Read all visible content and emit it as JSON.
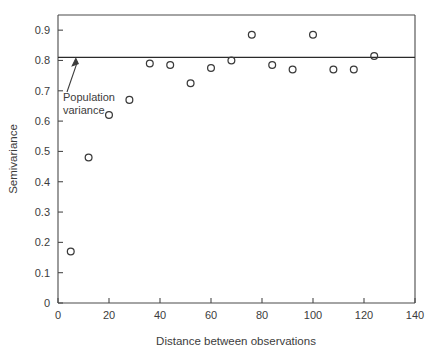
{
  "chart_data": {
    "type": "scatter",
    "title": "",
    "xlabel": "Distance between observations",
    "ylabel": "Semivariance",
    "xlim": [
      0,
      140
    ],
    "ylim": [
      0,
      0.95
    ],
    "xticks": [
      0,
      20,
      40,
      60,
      80,
      100,
      120,
      140
    ],
    "xtick_labels": [
      "0",
      "20",
      "40",
      "60",
      "80",
      "100",
      "120",
      "140"
    ],
    "yticks": [
      0,
      0.1,
      0.2,
      0.3,
      0.4,
      0.5,
      0.6,
      0.7,
      0.8,
      0.9
    ],
    "ytick_labels": [
      "0",
      "0.1",
      "0.2",
      "0.3",
      "0.4",
      "0.5",
      "0.6",
      "0.7",
      "0.8",
      "0.9"
    ],
    "grid": false,
    "legend": null,
    "marker": "open-circle",
    "marker_color": "#3a3a3a",
    "series": [
      {
        "name": "Empirical semivariogram",
        "x": [
          5,
          12,
          20,
          28,
          36,
          44,
          52,
          60,
          68,
          76,
          84,
          92,
          100,
          108,
          116,
          124
        ],
        "y": [
          0.17,
          0.48,
          0.62,
          0.67,
          0.79,
          0.785,
          0.725,
          0.775,
          0.8,
          0.885,
          0.785,
          0.77,
          0.885,
          0.77,
          0.77,
          0.815
        ]
      }
    ],
    "reference_lines": [
      {
        "name": "population-variance-line",
        "orientation": "horizontal",
        "value": 0.81,
        "color": "#2a2a2a"
      }
    ],
    "annotations": [
      {
        "name": "population-variance-annotation",
        "lines": [
          "Population",
          "variance"
        ],
        "text": "Population variance",
        "target_x": 7,
        "target_y": 0.81,
        "text_x": 4,
        "text_y": 0.7,
        "has_arrow": true
      }
    ]
  },
  "figure": {
    "background_color": "#ffffff",
    "axis_color": "#4a4a4a",
    "text_color": "#3c3c3c"
  }
}
